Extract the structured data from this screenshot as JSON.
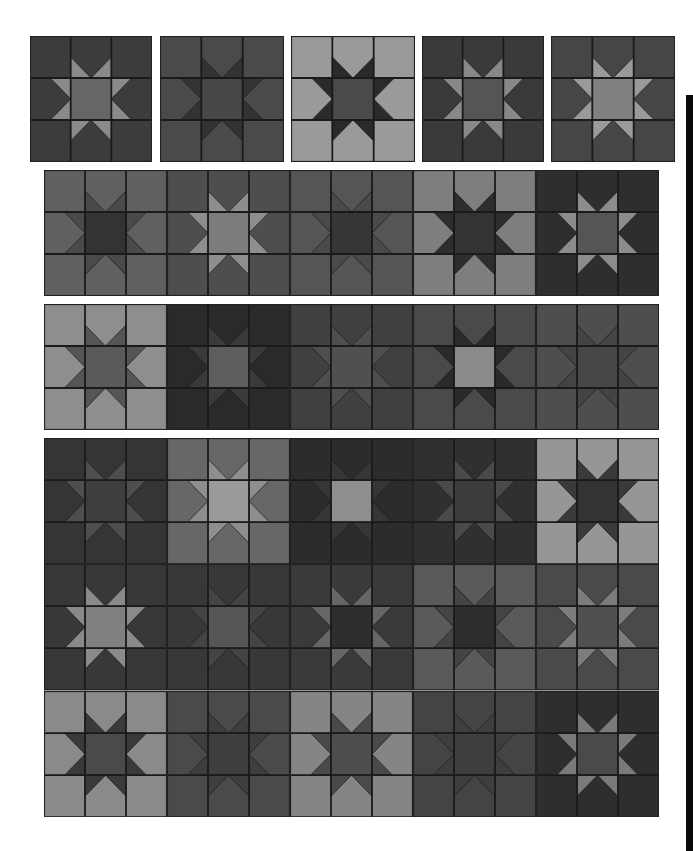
{
  "colors": {
    "page_bg": "#ffffff",
    "seam": "#1a1a1a",
    "edge_bar": "#0a0a0a"
  },
  "single_blocks": {
    "y": 36,
    "height": 126,
    "items": [
      {
        "x": 30,
        "w": 122,
        "bg": "#3c3c3c",
        "pt": "#8a8a8a",
        "ct": "#666666"
      },
      {
        "x": 160,
        "w": 124,
        "bg": "#4a4a4a",
        "pt": "#333333",
        "ct": "#474747"
      },
      {
        "x": 291,
        "w": 124,
        "bg": "#9a9a9a",
        "pt": "#2a2a2a",
        "ct": "#4a4a4a"
      },
      {
        "x": 422,
        "w": 122,
        "bg": "#3a3a3a",
        "pt": "#888888",
        "ct": "#555555"
      },
      {
        "x": 551,
        "w": 124,
        "bg": "#464646",
        "pt": "#9a9a9a",
        "ct": "#808080"
      }
    ]
  },
  "strips": [
    {
      "x": 44,
      "y": 170,
      "block_w": 123,
      "block_h": 126,
      "rows": [
        [
          {
            "bg": "#606060",
            "pt": "#4a4a4a",
            "ct": "#333333"
          },
          {
            "bg": "#4e4e4e",
            "pt": "#8e8e8e",
            "ct": "#7c7c7c"
          },
          {
            "bg": "#555555",
            "pt": "#4a4a4a",
            "ct": "#363636"
          },
          {
            "bg": "#7e7e7e",
            "pt": "#2e2e2e",
            "ct": "#333333"
          },
          {
            "bg": "#2e2e2e",
            "pt": "#8c8c8c",
            "ct": "#555555"
          }
        ]
      ]
    },
    {
      "x": 44,
      "y": 304,
      "block_w": 123,
      "block_h": 126,
      "rows": [
        [
          {
            "bg": "#8e8e8e",
            "pt": "#555555",
            "ct": "#5a5a5a"
          },
          {
            "bg": "#2a2a2a",
            "pt": "#3a3a3a",
            "ct": "#5e5e5e"
          },
          {
            "bg": "#404040",
            "pt": "#4e4e4e",
            "ct": "#505050"
          },
          {
            "bg": "#4a4a4a",
            "pt": "#2a2a2a",
            "ct": "#8a8a8a"
          },
          {
            "bg": "#4e4e4e",
            "pt": "#444444",
            "ct": "#474747"
          }
        ]
      ]
    },
    {
      "x": 44,
      "y": 438,
      "block_w": 123,
      "block_h": 126.3,
      "rows": [
        [
          {
            "bg": "#353535",
            "pt": "#4e4e4e",
            "ct": "#3e3e3e"
          },
          {
            "bg": "#676767",
            "pt": "#8e8e8e",
            "ct": "#9a9a9a"
          },
          {
            "bg": "#2c2c2c",
            "pt": "#363636",
            "ct": "#8e8e8e"
          },
          {
            "bg": "#303030",
            "pt": "#4a4a4a",
            "ct": "#3c3c3c"
          },
          {
            "bg": "#969696",
            "pt": "#3a3a3a",
            "ct": "#333333"
          }
        ],
        [
          {
            "bg": "#383838",
            "pt": "#8a8a8a",
            "ct": "#808080"
          },
          {
            "bg": "#383838",
            "pt": "#444444",
            "ct": "#555555"
          },
          {
            "bg": "#3a3a3a",
            "pt": "#666666",
            "ct": "#2e2e2e"
          },
          {
            "bg": "#5a5a5a",
            "pt": "#444444",
            "ct": "#2e2e2e"
          },
          {
            "bg": "#4a4a4a",
            "pt": "#7c7c7c",
            "ct": "#505050"
          }
        ],
        [
          {
            "bg": "#8a8a8a",
            "pt": "#3a3a3a",
            "ct": "#4a4a4a"
          },
          {
            "bg": "#4a4a4a",
            "pt": "#3e3e3e",
            "ct": "#3e3e3e"
          },
          {
            "bg": "#858585",
            "pt": "#4a4a4a",
            "ct": "#4e4e4e"
          },
          {
            "bg": "#444444",
            "pt": "#3e3e3e",
            "ct": "#3e3e3e"
          },
          {
            "bg": "#2e2e2e",
            "pt": "#7a7a7a",
            "ct": "#4a4a4a"
          }
        ]
      ]
    }
  ],
  "edge_bar": {
    "x": 686,
    "y": 95,
    "w": 7,
    "h": 756
  }
}
